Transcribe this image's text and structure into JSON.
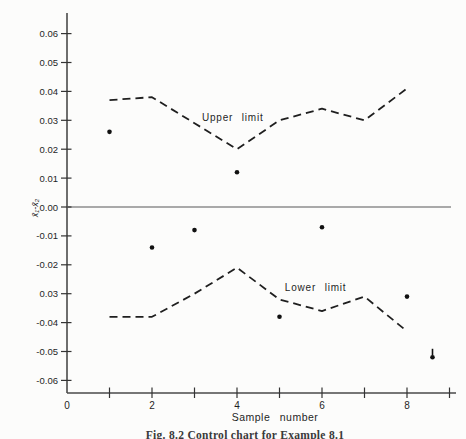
{
  "page": {
    "background": "#fcfcfb",
    "ink": "#1f1f1f",
    "axis_color": "#4a4a4a",
    "zero_line_color": "#8e8e8e"
  },
  "figure_caption": "Fig. 8.2 Control chart for Example 8.1",
  "chart_data": {
    "type": "scatter",
    "title": "",
    "xlabel": "Sample number",
    "ylabel": "x̄₁-x̄₂",
    "xlim": [
      0,
      9.2
    ],
    "ylim": [
      -0.068,
      0.068
    ],
    "grid": false,
    "x_axis": {
      "tick_positions": [
        1,
        2,
        3,
        4,
        5,
        6,
        7,
        8,
        9
      ],
      "labeled_ticks": [
        {
          "value": 0,
          "label": "0"
        },
        {
          "value": 2,
          "label": "2"
        },
        {
          "value": 4,
          "label": "4"
        },
        {
          "value": 6,
          "label": "6"
        },
        {
          "value": 8,
          "label": "8"
        }
      ]
    },
    "y_axis": {
      "ticks": [
        {
          "value": 0.06,
          "label": "0.06"
        },
        {
          "value": 0.05,
          "label": "0.05"
        },
        {
          "value": 0.04,
          "label": "0.04"
        },
        {
          "value": 0.03,
          "label": "0.03"
        },
        {
          "value": 0.02,
          "label": "0.02"
        },
        {
          "value": 0.01,
          "label": "0.01"
        },
        {
          "value": 0.0,
          "label": "0.00"
        },
        {
          "value": -0.01,
          "label": "-0.01"
        },
        {
          "value": -0.02,
          "label": "-0.02"
        },
        {
          "value": -0.03,
          "label": "0.03"
        },
        {
          "value": -0.04,
          "label": "-0.04"
        },
        {
          "value": -0.05,
          "label": "-0.05"
        },
        {
          "value": -0.06,
          "label": "-0.06"
        }
      ]
    },
    "zero_line": {
      "value": 0.0
    },
    "series": [
      {
        "name": "sample-points",
        "type": "scatter",
        "points": [
          {
            "x": 1,
            "y": 0.026
          },
          {
            "x": 2,
            "y": -0.014
          },
          {
            "x": 3,
            "y": -0.008
          },
          {
            "x": 4,
            "y": 0.012
          },
          {
            "x": 5,
            "y": -0.038
          },
          {
            "x": 6,
            "y": -0.007
          },
          {
            "x": 8,
            "y": -0.031
          },
          {
            "x": 8.6,
            "y": -0.052,
            "marker": "dot-with-tick-above"
          }
        ]
      },
      {
        "name": "upper-limit",
        "type": "line",
        "style": "dashed",
        "label": "Upper limit",
        "x": [
          1,
          2,
          3,
          4,
          5,
          6,
          7,
          8
        ],
        "y": [
          0.037,
          0.038,
          0.029,
          0.02,
          0.03,
          0.034,
          0.03,
          0.041
        ]
      },
      {
        "name": "lower-limit",
        "type": "line",
        "style": "dashed",
        "label": "Lower limit",
        "x": [
          1,
          2,
          3,
          4,
          5,
          6,
          7,
          8
        ],
        "y": [
          -0.038,
          -0.038,
          -0.03,
          -0.021,
          -0.032,
          -0.036,
          -0.031,
          -0.043
        ]
      }
    ],
    "annotations": [
      {
        "text": "Upper limit",
        "x": 3.9,
        "y": 0.031
      },
      {
        "text": "Lower limit",
        "x": 5.85,
        "y": -0.028
      }
    ]
  }
}
